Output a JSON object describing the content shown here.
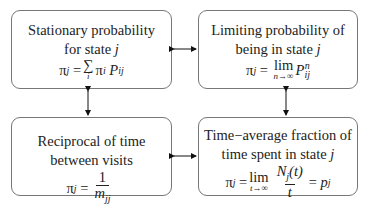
{
  "diagram": {
    "boxes": [
      {
        "id": "stationary",
        "line1": "Stationary probability",
        "line2_text": "for state ",
        "line2_var": "j",
        "equation": {
          "lhs": "π",
          "lhs_sub": "j",
          "eq": "=",
          "op": "∑",
          "op_under": "i",
          "t1": "π",
          "t1_sub": "i",
          "t2": "P",
          "t2_sub": "ij"
        }
      },
      {
        "id": "limiting",
        "line1": "Limiting probability of",
        "line2_text": "being in state ",
        "line2_var": "j",
        "equation": {
          "lhs": "π",
          "lhs_sub": "j",
          "eq": "=",
          "op": "lim",
          "op_under": "n→∞",
          "t1": "P",
          "t1_sub": "ij",
          "t1_sup": "n"
        }
      },
      {
        "id": "reciprocal",
        "line1": "Reciprocal of time",
        "line2_text": "between visits",
        "equation": {
          "lhs": "π",
          "lhs_sub": "j",
          "eq": "=",
          "num": "1",
          "den": "m",
          "den_sub": "jj"
        }
      },
      {
        "id": "time-average",
        "line1": "Time−average fraction of",
        "line2_text": "time spent in state ",
        "line2_var": "j",
        "equation": {
          "lhs": "π",
          "lhs_sub": "j",
          "eq": "=",
          "op": "lim",
          "op_under": "t→∞",
          "num": "N",
          "num_sub": "j",
          "num_arg": "(t)",
          "den": "t",
          "eq2": "=",
          "rhs": "p",
          "rhs_sub": "j"
        }
      }
    ],
    "arrows": [
      {
        "from": "stationary",
        "to": "limiting",
        "type": "bidirectional-horizontal"
      },
      {
        "from": "stationary",
        "to": "reciprocal",
        "type": "bidirectional-vertical"
      },
      {
        "from": "limiting",
        "to": "time-average",
        "type": "bidirectional-vertical"
      },
      {
        "from": "reciprocal",
        "to": "time-average",
        "type": "bidirectional-horizontal"
      }
    ]
  }
}
